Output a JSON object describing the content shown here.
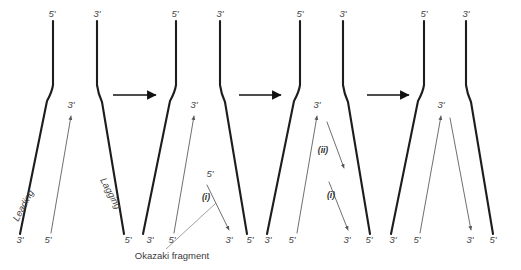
{
  "figure": {
    "background_color": "#ffffff",
    "parent_strand_color": "#1d1d1d",
    "new_strand_color": "#555555",
    "label_color": "#444444",
    "arrow_color": "#111111"
  },
  "labels": {
    "five_prime": "5'",
    "three_prime": "3'",
    "leading": "Leading",
    "lagging": "Lagging",
    "okazaki": "Okazaki fragment",
    "roman_i": "(i)",
    "roman_ii": "(ii)"
  },
  "panels": [
    {
      "id": "panel-1",
      "name": "fork-initiation",
      "top_labels": [
        {
          "text": "5'",
          "x": 52,
          "y": 17
        },
        {
          "text": "3'",
          "x": 97,
          "y": 17
        }
      ],
      "bottom_labels": [
        {
          "text": "3'",
          "x": 20,
          "y": 243
        },
        {
          "text": "5'",
          "x": 48,
          "y": 243
        }
      ],
      "inner_labels": [
        {
          "text": "3'",
          "x": 71,
          "y": 108
        }
      ],
      "strand_labels": [
        {
          "text": "Leading",
          "x": 26,
          "y": 207,
          "rotate": -62
        },
        {
          "text": "Lagging",
          "x": 108,
          "y": 195,
          "rotate": 62
        }
      ]
    },
    {
      "id": "panel-2",
      "name": "first-okazaki-fragment",
      "top_labels": [
        {
          "text": "5'",
          "x": 175,
          "y": 17
        },
        {
          "text": "3'",
          "x": 220,
          "y": 17
        }
      ],
      "bottom_labels": [
        {
          "text": "5'",
          "x": 128,
          "y": 243
        },
        {
          "text": "3'",
          "x": 150,
          "y": 243
        },
        {
          "text": "5'",
          "x": 172,
          "y": 243
        },
        {
          "text": "3'",
          "x": 229,
          "y": 243
        },
        {
          "text": "5'",
          "x": 250,
          "y": 243
        }
      ],
      "inner_labels": [
        {
          "text": "3'",
          "x": 194,
          "y": 108
        },
        {
          "text": "5'",
          "x": 210,
          "y": 177
        }
      ],
      "roman_labels": [
        {
          "text": "(i)",
          "x": 206,
          "y": 200
        }
      ],
      "caption": {
        "text": "Okazaki fragment",
        "x": 172,
        "y": 256
      }
    },
    {
      "id": "panel-3",
      "name": "second-okazaki-fragment",
      "top_labels": [
        {
          "text": "5'",
          "x": 300,
          "y": 17
        },
        {
          "text": "3'",
          "x": 343,
          "y": 17
        }
      ],
      "bottom_labels": [
        {
          "text": "3'",
          "x": 268,
          "y": 243
        },
        {
          "text": "5'",
          "x": 292,
          "y": 243
        },
        {
          "text": "3'",
          "x": 347,
          "y": 243
        },
        {
          "text": "5'",
          "x": 369,
          "y": 243
        }
      ],
      "inner_labels": [
        {
          "text": "3'",
          "x": 317,
          "y": 108
        }
      ],
      "roman_labels": [
        {
          "text": "(ii)",
          "x": 323,
          "y": 153
        },
        {
          "text": "(i)",
          "x": 331,
          "y": 198
        }
      ]
    },
    {
      "id": "panel-4",
      "name": "fragments-joined",
      "top_labels": [
        {
          "text": "5'",
          "x": 424,
          "y": 17
        },
        {
          "text": "3'",
          "x": 466,
          "y": 17
        }
      ],
      "bottom_labels": [
        {
          "text": "3'",
          "x": 393,
          "y": 243
        },
        {
          "text": "5'",
          "x": 417,
          "y": 243
        },
        {
          "text": "3'",
          "x": 470,
          "y": 243
        },
        {
          "text": "5'",
          "x": 493,
          "y": 243
        }
      ],
      "inner_labels": [
        {
          "text": "3'",
          "x": 441,
          "y": 108
        }
      ]
    }
  ],
  "step_arrows": [
    {
      "name": "step-arrow-1",
      "x1": 113,
      "x2": 156,
      "y": 95
    },
    {
      "name": "step-arrow-2",
      "x1": 239,
      "x2": 281,
      "y": 95
    },
    {
      "name": "step-arrow-3",
      "x1": 367,
      "x2": 409,
      "y": 95
    }
  ]
}
